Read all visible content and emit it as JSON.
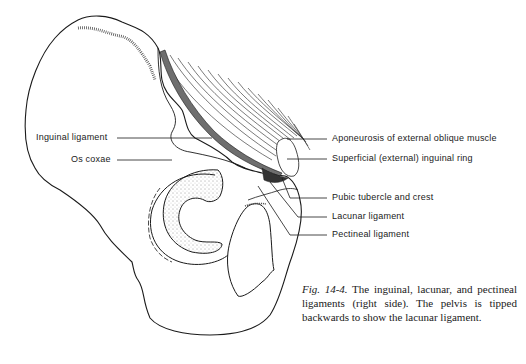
{
  "figure": {
    "labels": {
      "left": [
        {
          "id": "inguinal-ligament",
          "text": "Inguinal ligament"
        },
        {
          "id": "os-coxae",
          "text": "Os coxae"
        }
      ],
      "right": [
        {
          "id": "aponeurosis",
          "text": "Aponeurosis of external oblique muscle"
        },
        {
          "id": "superficial-ring",
          "text": "Superficial (external) inguinal ring"
        },
        {
          "id": "pubic-tubercle",
          "text": "Pubic tubercle and crest"
        },
        {
          "id": "lacunar-ligament",
          "text": "Lacunar ligament"
        },
        {
          "id": "pectineal-ligament",
          "text": "Pectineal ligament"
        }
      ]
    },
    "caption": {
      "number": "Fig. 14-4.",
      "text": "The inguinal, lacunar, and pectineal ligaments (right side). The pelvis is tipped backwards to show the lacunar ligament."
    }
  },
  "colors": {
    "ink": "#1a1a1a",
    "ligament_band": "#6e6e6e",
    "background": "#ffffff"
  }
}
